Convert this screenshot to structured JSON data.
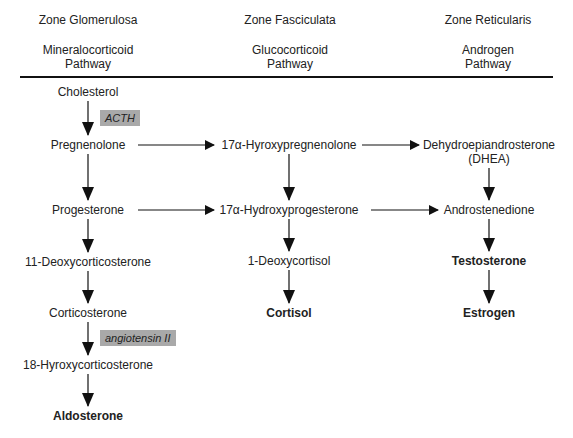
{
  "zones": [
    {
      "name": "Zone Glomerulosa",
      "pathway_line1": "Mineralocorticoid",
      "pathway_line2": "Pathway"
    },
    {
      "name": "Zone Fasciculata",
      "pathway_line1": "Glucocorticoid",
      "pathway_line2": "Pathway"
    },
    {
      "name": "Zone Reticularis",
      "pathway_line1": "Androgen",
      "pathway_line2": "Pathway"
    }
  ],
  "left": {
    "cholesterol": "Cholesterol",
    "pregnenolone": "Pregnenolone",
    "progesterone": "Progesterone",
    "deoxycorticosterone": "11-Deoxycorticosterone",
    "corticosterone": "Corticosterone",
    "hydroxycorticosterone": "18-Hyroxycorticosterone",
    "aldosterone": "Aldosterone"
  },
  "middle": {
    "hydroxypregnenolone": "17α-Hyroxypregnenolone",
    "hydroxyprogesterone": "17α-Hydroxyprogesterone",
    "deoxycortisol": "1-Deoxycortisol",
    "cortisol": "Cortisol"
  },
  "right": {
    "dhea_line1": "Dehydroepiandrosterone",
    "dhea_line2": "(DHEA)",
    "androstenedione": "Androstenedione",
    "testosterone": "Testosterone",
    "estrogen": "Estrogen"
  },
  "regulators": {
    "acth": "ACTH",
    "angiotensin": "angiotensin II"
  },
  "colors": {
    "regulator_box": "#a9a9a9",
    "text": "#222222",
    "arrows": "#111111"
  }
}
